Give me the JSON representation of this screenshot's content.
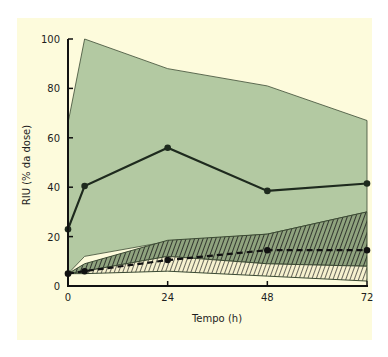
{
  "chart_data": {
    "type": "area",
    "title": "",
    "xlabel": "Tempo (h)",
    "ylabel": "RIU (% da dose)",
    "xlim": [
      0,
      72
    ],
    "ylim": [
      0,
      100
    ],
    "x_ticks": [
      0,
      24,
      48,
      72
    ],
    "y_ticks": [
      0,
      20,
      40,
      60,
      80,
      100
    ],
    "grid": false,
    "legend": null,
    "x": [
      0,
      4,
      24,
      48,
      72
    ],
    "series": [
      {
        "name": "range-high (green band)",
        "kind": "band",
        "upper": [
          66,
          100,
          88,
          81,
          67
        ],
        "lower": [
          5,
          12,
          18,
          21,
          30
        ],
        "color": "#b3c9a2"
      },
      {
        "name": "range-low (dark hatched band)",
        "kind": "band",
        "upper": [
          5,
          9,
          18.5,
          21,
          30
        ],
        "lower": [
          5,
          6,
          12,
          9,
          8
        ],
        "color": "#2a2a2a",
        "pattern": "dense-diagonal-hatch"
      },
      {
        "name": "range-low lower (light hatched band)",
        "kind": "band",
        "upper": [
          5,
          6,
          12,
          9,
          8
        ],
        "lower": [
          5,
          5,
          6,
          4,
          2
        ],
        "color": "#3a3a3a",
        "pattern": "diagonal-hatch-on-cream"
      },
      {
        "name": "mean high uptake",
        "kind": "line",
        "style": "solid",
        "markers": true,
        "values": [
          23,
          40.5,
          56,
          38.5,
          41.5
        ],
        "color": "#1e2a1e"
      },
      {
        "name": "mean low uptake",
        "kind": "line",
        "style": "dashed",
        "markers": true,
        "values": [
          5,
          6,
          10.5,
          14.5,
          14.5
        ],
        "color": "#111111"
      }
    ]
  },
  "labels": {
    "xlabel": "Tempo (h)",
    "ylabel": "RIU (% da dose)",
    "x_ticks": [
      "0",
      "24",
      "48",
      "72"
    ],
    "y_ticks": [
      "0",
      "20",
      "40",
      "60",
      "80",
      "100"
    ]
  }
}
